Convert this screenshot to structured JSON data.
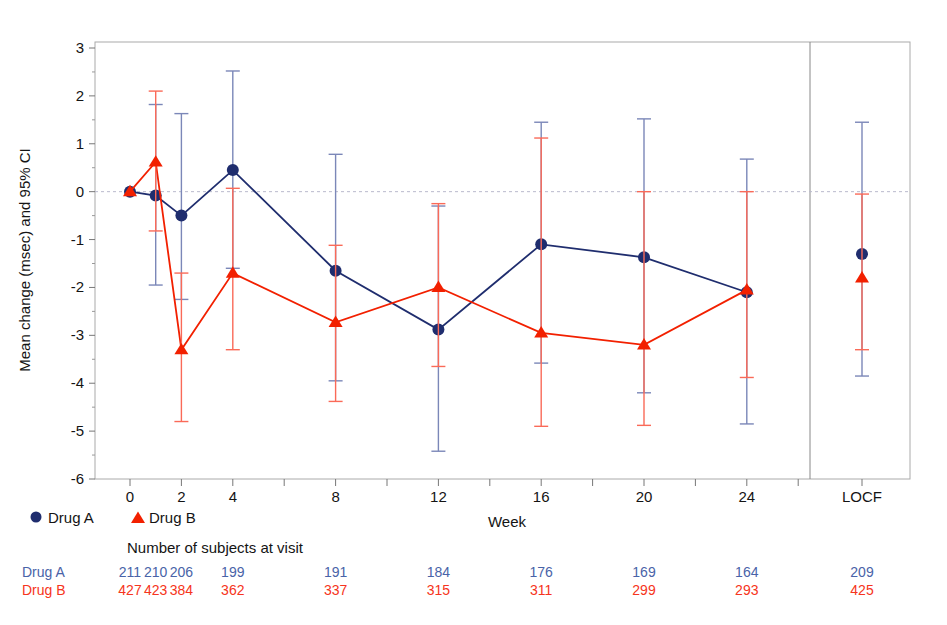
{
  "chart_data": {
    "type": "line",
    "title": "",
    "xlabel": "Week",
    "ylabel": "Mean change (msec) and 95% CI",
    "ylim": [
      -6,
      3
    ],
    "ytick_labels": [
      "3",
      "2",
      "1",
      "0",
      "-1",
      "-2",
      "-3",
      "-4",
      "-5",
      "-6"
    ],
    "ytick_values": [
      3,
      2,
      1,
      0,
      -1,
      -2,
      -3,
      -4,
      -5,
      -6
    ],
    "xtick_labels": [
      "0",
      "2",
      "4",
      "8",
      "12",
      "16",
      "20",
      "24",
      "LOCF"
    ],
    "grid": false,
    "zero_reference_line": 0,
    "legend_position": "below-left",
    "categories": [
      "0",
      "1",
      "2",
      "4",
      "8",
      "12",
      "16",
      "20",
      "24",
      "LOCF"
    ],
    "series": [
      {
        "name": "Drug A",
        "marker": "circle",
        "color": "#1f2d6e",
        "values": [
          0.0,
          -0.08,
          -0.5,
          0.45,
          -1.65,
          -2.88,
          -1.1,
          -1.37,
          -2.1,
          -1.3
        ],
        "ci_lower": [
          0.0,
          -1.95,
          -2.25,
          -1.6,
          -3.95,
          -5.42,
          -3.58,
          -4.2,
          -4.85,
          -3.85
        ],
        "ci_upper": [
          0.0,
          1.82,
          1.63,
          2.52,
          0.78,
          -0.3,
          1.45,
          1.52,
          0.68,
          1.45
        ]
      },
      {
        "name": "Drug B",
        "marker": "triangle",
        "color": "#f22000",
        "values": [
          0.0,
          0.62,
          -3.3,
          -1.7,
          -2.73,
          -2.0,
          -2.95,
          -3.2,
          -2.05,
          -1.8
        ],
        "ci_lower": [
          0.0,
          -0.82,
          -4.8,
          -3.3,
          -4.38,
          -3.65,
          -4.9,
          -4.88,
          -3.88,
          -3.3
        ],
        "ci_upper": [
          0.0,
          2.1,
          -1.7,
          0.07,
          -1.12,
          -0.25,
          1.12,
          0.0,
          0.0,
          -0.05
        ]
      }
    ]
  },
  "legend": {
    "items": [
      {
        "label": "Drug A",
        "marker": "circle",
        "color": "#1f2d6e"
      },
      {
        "label": "Drug B",
        "marker": "triangle",
        "color": "#f22000"
      }
    ]
  },
  "subjects_table": {
    "heading": "Number of subjects at visit",
    "rows": [
      {
        "label": "Drug A",
        "color": "#4963a8",
        "values": [
          "211",
          "210",
          "206",
          "199",
          "191",
          "184",
          "176",
          "169",
          "164",
          "209"
        ]
      },
      {
        "label": "Drug B",
        "color": "#f63420",
        "values": [
          "427",
          "423",
          "384",
          "362",
          "337",
          "315",
          "311",
          "299",
          "293",
          "425"
        ]
      }
    ]
  }
}
